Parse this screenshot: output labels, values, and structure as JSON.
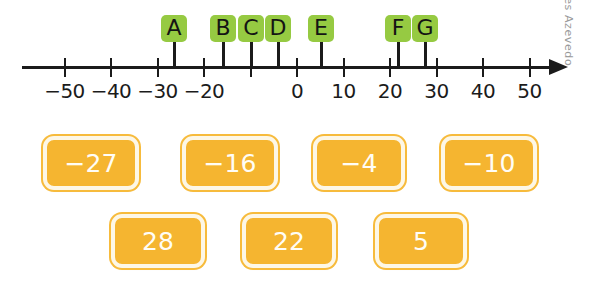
{
  "figure": {
    "type": "number-line",
    "watermark": "Tamires Azevedo",
    "axis": {
      "min": -55,
      "max": 55,
      "tick_step": 10,
      "origin_x": 297,
      "pixels_per_10_units": 46.5,
      "tick_values": [
        -50,
        -40,
        -30,
        -20,
        -10,
        0,
        10,
        20,
        30,
        40,
        50
      ],
      "tick_labels": [
        "−50",
        "−40",
        "−30",
        "−20",
        "",
        "0",
        "10",
        "20",
        "30",
        "40",
        "50"
      ]
    },
    "markers": [
      {
        "letter": "A",
        "value": -26,
        "x": 174
      },
      {
        "letter": "B",
        "value": -16,
        "x": 223
      },
      {
        "letter": "C",
        "value": -10,
        "x": 251
      },
      {
        "letter": "D",
        "value": -4,
        "x": 278
      },
      {
        "letter": "E",
        "value": 5,
        "x": 321
      },
      {
        "letter": "F",
        "value": 22,
        "x": 398
      },
      {
        "letter": "G",
        "value": 28,
        "x": 425
      }
    ],
    "marker_box_color": "#96ca42",
    "axis_color": "#1b1b1b"
  },
  "cards": {
    "fill_color": "#f5b530",
    "border_color": "#fdf7e6",
    "text_color": "#fffdf6",
    "rows": [
      [
        {
          "label": "−27",
          "x": 43,
          "y": 21,
          "w": 96,
          "h": 54
        },
        {
          "label": "−16",
          "x": 182,
          "y": 21,
          "w": 96,
          "h": 54
        },
        {
          "label": "−4",
          "x": 313,
          "y": 21,
          "w": 92,
          "h": 54
        },
        {
          "label": "−10",
          "x": 441,
          "y": 21,
          "w": 96,
          "h": 54
        }
      ],
      [
        {
          "label": "28",
          "x": 111,
          "y": 99,
          "w": 94,
          "h": 54
        },
        {
          "label": "22",
          "x": 242,
          "y": 99,
          "w": 94,
          "h": 54
        },
        {
          "label": "5",
          "x": 375,
          "y": 99,
          "w": 92,
          "h": 54
        }
      ]
    ]
  },
  "chart_data": {
    "type": "number-line",
    "title": "",
    "xlabel": "",
    "xlim": [
      -55,
      55
    ],
    "grid": false,
    "tick_labels": [
      "−50",
      "−40",
      "−30",
      "−20",
      "0",
      "10",
      "20",
      "30",
      "40",
      "50"
    ],
    "points": [
      {
        "name": "A",
        "value": -26
      },
      {
        "name": "B",
        "value": -16
      },
      {
        "name": "C",
        "value": -10
      },
      {
        "name": "D",
        "value": -4
      },
      {
        "name": "E",
        "value": 5
      },
      {
        "name": "F",
        "value": 22
      },
      {
        "name": "G",
        "value": 28
      }
    ],
    "value_cards": [
      "−27",
      "−16",
      "−4",
      "−10",
      "28",
      "22",
      "5"
    ]
  }
}
